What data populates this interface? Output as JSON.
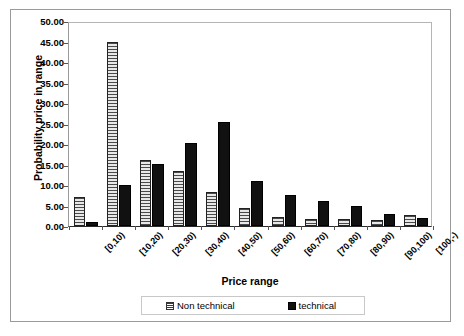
{
  "chart_data": {
    "type": "bar",
    "title": "",
    "xlabel": "Price range",
    "ylabel": "Probability price in range",
    "categories": [
      "[0,10)",
      "[10,20)",
      "[20,30)",
      "[30,40)",
      "[40,50)",
      "[50,60)",
      "[60,70)",
      "[70,80)",
      "[80,90)",
      "[90,100)",
      "[100,-)"
    ],
    "series": [
      {
        "name": "Non technical",
        "values": [
          7.0,
          45.0,
          16.2,
          13.3,
          8.2,
          4.5,
          2.3,
          1.6,
          1.6,
          1.5,
          2.7
        ]
      },
      {
        "name": "technical",
        "values": [
          1.0,
          10.0,
          15.2,
          20.3,
          25.3,
          11.0,
          7.5,
          6.0,
          4.8,
          3.0,
          2.0
        ]
      }
    ],
    "ylim": [
      0.0,
      50.0
    ],
    "ytick_values": [
      "0.00",
      "5.00",
      "10.00",
      "15.00",
      "20.00",
      "25.00",
      "30.00",
      "35.00",
      "40.00",
      "45.00",
      "50.00"
    ],
    "ytick_numbers": [
      0,
      5,
      10,
      15,
      20,
      25,
      30,
      35,
      40,
      45,
      50
    ],
    "grid": false,
    "legend_position": "bottom",
    "colors": {
      "non_technical_fill": "#e8e8e8",
      "non_technical_hatch": "#4a4a4a",
      "technical_fill": "#111111",
      "axis": "#2b2b2b",
      "border": "#9a9a9a",
      "text": "#000000"
    }
  },
  "legend": {
    "entries": [
      {
        "label": "Non technical",
        "swatch": "hatched-square-icon"
      },
      {
        "label": "technical",
        "swatch": "filled-square-icon"
      }
    ]
  }
}
